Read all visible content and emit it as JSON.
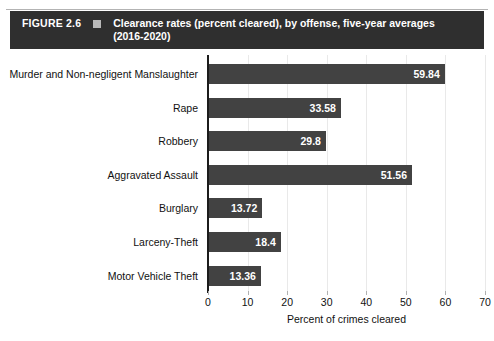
{
  "header": {
    "figure_number": "FIGURE 2.6",
    "marker_icon": "square-marker-icon",
    "title_line1": "Clearance rates (percent cleared), by offense, five-year averages",
    "title_line2": "(2016-2020)",
    "background_color": "#2f2f2f",
    "text_color": "#ffffff"
  },
  "chart_data": {
    "type": "bar",
    "orientation": "horizontal",
    "title": "Clearance rates (percent cleared), by offense, five-year averages (2016-2020)",
    "xlabel": "Percent of crimes cleared",
    "ylabel": "",
    "categories": [
      "Murder and Non-negligent Manslaughter",
      "Rape",
      "Robbery",
      "Aggravated Assault",
      "Burglary",
      "Larceny-Theft",
      "Motor Vehicle Theft"
    ],
    "values": [
      59.84,
      33.58,
      29.8,
      51.56,
      13.72,
      18.4,
      13.36
    ],
    "value_labels": [
      "59.84",
      "33.58",
      "29.8",
      "51.56",
      "13.72",
      "18.4",
      "13.36"
    ],
    "xlim": [
      0,
      70
    ],
    "xticks": [
      0,
      10,
      20,
      30,
      40,
      50,
      60,
      70
    ],
    "xtick_labels": [
      "0",
      "10",
      "20",
      "30",
      "40",
      "50",
      "60",
      "70"
    ],
    "grid": true,
    "grid_axis": "x",
    "grid_color": "#e9e9e9",
    "bar_color": "#424242",
    "value_label_color": "#ffffff",
    "legend": null
  }
}
